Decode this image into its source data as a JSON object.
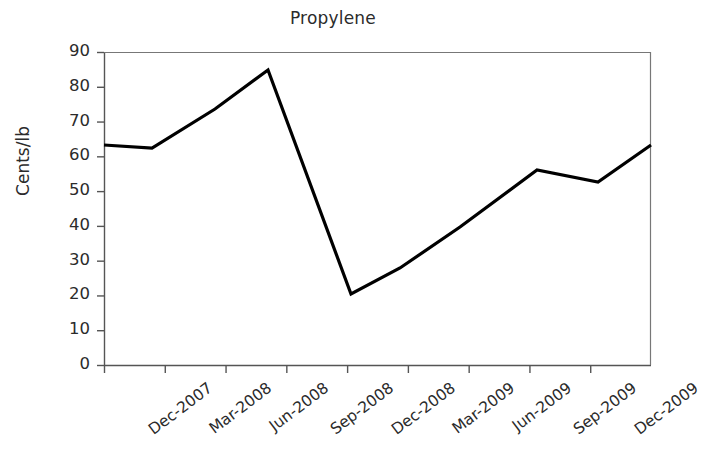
{
  "chart_data": {
    "type": "line",
    "title": "Propylene",
    "xlabel": "",
    "ylabel": "Cents/lb",
    "ylim": [
      0,
      90
    ],
    "ytick_values": [
      90,
      80,
      70,
      60,
      50,
      40,
      30,
      20,
      10,
      0
    ],
    "ytick_labels": [
      "90",
      "80",
      "70",
      "60",
      "50",
      "40",
      "30",
      "20",
      "10",
      "0"
    ],
    "categories": [
      "Dec-2007",
      "Mar-2008",
      "Jun-2008",
      "Sep-2008",
      "Dec-2008",
      "Mar-2009",
      "Jun-2009",
      "Sep-2009",
      "Dec-2009"
    ],
    "grid": false,
    "legend": "none",
    "series": [
      {
        "name": "Propylene",
        "color": "#000000",
        "x": [
          "Dec-2007",
          "Mar-2008",
          "Jun-2008",
          "Aug-2008",
          "Jan-2009",
          "Mar-2009",
          "Jun-2009",
          "Oct-2009",
          "Dec-2009",
          "Mar-2010"
        ],
        "values": [
          62.2,
          61.4,
          73.1,
          84.8,
          19.5,
          28.0,
          39.7,
          56.0,
          52.7,
          62.2
        ]
      }
    ],
    "points_pixel_hint": [
      [
        104,
        145
      ],
      [
        152,
        148
      ],
      [
        215,
        109
      ],
      [
        268,
        70
      ],
      [
        351,
        294
      ],
      [
        400,
        268
      ],
      [
        460,
        227
      ],
      [
        537,
        170
      ],
      [
        598,
        182
      ],
      [
        651,
        145
      ]
    ],
    "axis_box_pixels": {
      "left": 104,
      "right": 651,
      "top": 52,
      "bottom": 365
    }
  }
}
